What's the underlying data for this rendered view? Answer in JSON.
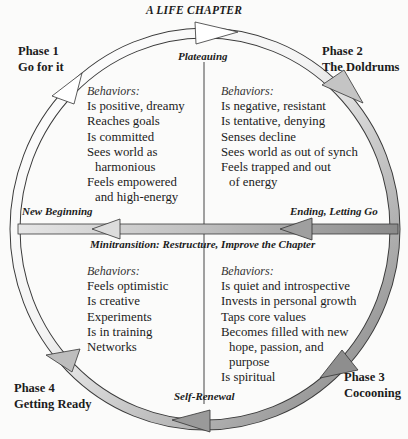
{
  "title": "A LIFE CHAPTER",
  "colors": {
    "background": "#fbfbfa",
    "arrow_light": "#ffffff",
    "arrow_mid": "#cfcfcf",
    "arrow_dark": "#8a8a8a",
    "stroke": "#333333"
  },
  "phases": {
    "phase1": {
      "number": "Phase 1",
      "name": "Go for it"
    },
    "phase2": {
      "number": "Phase 2",
      "name": "The Doldrums"
    },
    "phase3": {
      "number": "Phase 3",
      "name": "Cocooning"
    },
    "phase4": {
      "number": "Phase 4",
      "name": "Getting Ready"
    }
  },
  "arrow_labels": {
    "top": "Plateauing",
    "bottom": "Self-Renewal",
    "left": "New Beginning",
    "right": "Ending, Letting Go",
    "middle": "Minitransition: Restructure, Improve the Chapter"
  },
  "quadrants": {
    "top_left": {
      "header": "Behaviors:",
      "lines": [
        "Is positive, dreamy",
        "Reaches goals",
        "Is committed",
        "Sees world as",
        "harmonious",
        "Feels empowered",
        "and high-energy"
      ]
    },
    "top_right": {
      "header": "Behaviors:",
      "lines": [
        "Is negative, resistant",
        "Is tentative, denying",
        "Senses decline",
        "Sees world as out of synch",
        "Feels trapped and out",
        "of energy"
      ]
    },
    "bottom_left": {
      "header": "Behaviors:",
      "lines": [
        "Feels optimistic",
        "Is creative",
        "Experiments",
        "Is in training",
        "Networks"
      ]
    },
    "bottom_right": {
      "header": "Behaviors:",
      "lines": [
        "Is quiet and introspective",
        "Invests in personal growth",
        "Taps core values",
        "Becomes filled with new",
        "hope, passion, and",
        "purpose",
        "Is spiritual"
      ]
    }
  }
}
